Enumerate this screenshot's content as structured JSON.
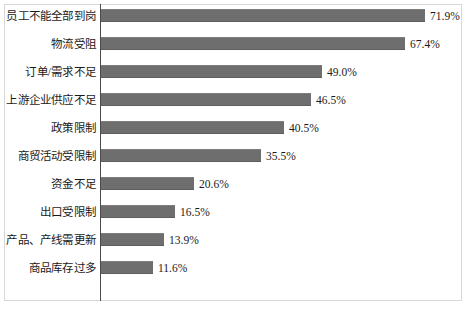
{
  "chart_data": {
    "type": "bar",
    "orientation": "horizontal",
    "title": "",
    "subtitle": "",
    "xlabel": "",
    "ylabel": "",
    "xlim": [
      0,
      80
    ],
    "grid": false,
    "legend": null,
    "value_format": "percent_one_decimal",
    "categories": [
      "员工不能全部到岗",
      "物流受阻",
      "订单/需求不足",
      "上游企业供应不足",
      "政策限制",
      "商贸活动受限制",
      "资金不足",
      "出口受限制",
      "产品、产线需更新",
      "商品库存过多"
    ],
    "values": [
      71.9,
      67.4,
      49.0,
      46.5,
      40.5,
      35.5,
      20.6,
      16.5,
      13.9,
      11.6
    ],
    "value_labels": [
      "71.9%",
      "67.4%",
      "49.0%",
      "46.5%",
      "40.5%",
      "35.5%",
      "20.6%",
      "16.5%",
      "13.9%",
      "11.6%"
    ],
    "colors": {
      "bar": "#6e6e6e",
      "axis": "#4a4a4a",
      "frame": "#d8d8d8",
      "text": "#1a1a1a",
      "background": "#ffffff"
    }
  }
}
